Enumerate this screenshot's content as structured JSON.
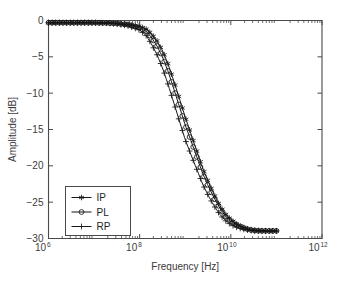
{
  "chart_data": {
    "type": "line",
    "title": "",
    "xlabel": "Frequency [Hz]",
    "ylabel": "Amplitude [dB]",
    "xscale": "log",
    "yscale": "linear",
    "xlim": [
      1000000,
      1000000000000
    ],
    "ylim": [
      -30,
      0
    ],
    "grid": false,
    "legend_position": "lower left",
    "xticks": [
      {
        "value": 1000000,
        "mantissa": "10",
        "exponent": "6",
        "label": "10^6"
      },
      {
        "value": 100000000,
        "mantissa": "10",
        "exponent": "8",
        "label": "10^8"
      },
      {
        "value": 10000000000,
        "mantissa": "10",
        "exponent": "10",
        "label": "10^10"
      },
      {
        "value": 1000000000000,
        "mantissa": "10",
        "exponent": "12",
        "label": "10^12"
      }
    ],
    "yticks": [
      {
        "value": 0,
        "label": "0"
      },
      {
        "value": -5,
        "label": "-5"
      },
      {
        "value": -10,
        "label": "-10"
      },
      {
        "value": -15,
        "label": "-15"
      },
      {
        "value": -20,
        "label": "-20"
      },
      {
        "value": -25,
        "label": "-25"
      },
      {
        "value": -30,
        "label": "-30"
      }
    ],
    "series": [
      {
        "name": "IP",
        "marker": "asterisk",
        "x": [
          1000000.0,
          1800000.0,
          3200000.0,
          5600000.0,
          10000000.0,
          18000000.0,
          32000000.0,
          56000000.0,
          100000000.0,
          140000000.0,
          180000000.0,
          240000000.0,
          320000000.0,
          420000000.0,
          560000000.0,
          750000000.0,
          1000000000.0,
          1400000000.0,
          1800000000.0,
          2400000000.0,
          3200000000.0,
          4200000000.0,
          5600000000.0,
          7500000000.0,
          10000000000.0,
          14000000000.0,
          18000000000.0,
          24000000000.0,
          32000000000.0,
          42000000000.0,
          56000000000.0,
          75000000000.0,
          100000000000.0
        ],
        "y": [
          -0.3,
          -0.3,
          -0.3,
          -0.3,
          -0.3,
          -0.32,
          -0.38,
          -0.5,
          -0.8,
          -1.2,
          -1.8,
          -2.8,
          -4.2,
          -6.0,
          -8.3,
          -10.8,
          -13.3,
          -16.0,
          -18.0,
          -20.3,
          -22.2,
          -23.8,
          -25.4,
          -26.6,
          -27.4,
          -28.1,
          -28.4,
          -28.7,
          -28.85,
          -28.9,
          -28.95,
          -28.95,
          -28.95
        ]
      },
      {
        "name": "PL",
        "marker": "circle",
        "x": [
          1000000.0,
          1800000.0,
          3200000.0,
          5600000.0,
          10000000.0,
          18000000.0,
          32000000.0,
          56000000.0,
          100000000.0,
          140000000.0,
          180000000.0,
          240000000.0,
          320000000.0,
          420000000.0,
          560000000.0,
          750000000.0,
          1000000000.0,
          1400000000.0,
          1800000000.0,
          2400000000.0,
          3200000000.0,
          4200000000.0,
          5600000000.0,
          7500000000.0,
          10000000000.0,
          14000000000.0,
          18000000000.0,
          24000000000.0,
          32000000000.0,
          42000000000.0,
          56000000000.0,
          75000000000.0,
          100000000000.0
        ],
        "y": [
          -0.3,
          -0.3,
          -0.3,
          -0.3,
          -0.3,
          -0.33,
          -0.42,
          -0.6,
          -1.0,
          -1.5,
          -2.3,
          -3.5,
          -5.1,
          -7.0,
          -9.4,
          -11.9,
          -14.4,
          -16.9,
          -18.8,
          -21.0,
          -22.8,
          -24.3,
          -25.7,
          -26.9,
          -27.6,
          -28.2,
          -28.5,
          -28.75,
          -28.9,
          -28.95,
          -28.95,
          -28.95,
          -28.95
        ]
      },
      {
        "name": "RP",
        "marker": "plus",
        "x": [
          1000000.0,
          1800000.0,
          3200000.0,
          5600000.0,
          10000000.0,
          18000000.0,
          32000000.0,
          56000000.0,
          100000000.0,
          140000000.0,
          180000000.0,
          240000000.0,
          320000000.0,
          420000000.0,
          560000000.0,
          750000000.0,
          1000000000.0,
          1400000000.0,
          1800000000.0,
          2400000000.0,
          3200000000.0,
          4200000000.0,
          5600000000.0,
          7500000000.0,
          10000000000.0,
          14000000000.0,
          18000000000.0,
          24000000000.0,
          32000000000.0,
          42000000000.0,
          56000000000.0,
          75000000000.0,
          100000000000.0
        ],
        "y": [
          -0.3,
          -0.3,
          -0.3,
          -0.3,
          -0.3,
          -0.35,
          -0.48,
          -0.75,
          -1.3,
          -2.1,
          -3.2,
          -4.7,
          -6.6,
          -8.8,
          -11.3,
          -13.9,
          -16.4,
          -18.8,
          -20.5,
          -22.5,
          -24.1,
          -25.4,
          -26.6,
          -27.5,
          -28.1,
          -28.5,
          -28.7,
          -28.85,
          -28.95,
          -28.95,
          -28.95,
          -28.95,
          -28.95
        ]
      }
    ],
    "legend": [
      {
        "label": "IP",
        "marker": "asterisk"
      },
      {
        "label": "PL",
        "marker": "circle"
      },
      {
        "label": "RP",
        "marker": "plus"
      }
    ],
    "colors": {
      "series": "#171717",
      "axis": "#4a4a4a",
      "text": "#3b3b3b",
      "background": "#ffffff"
    }
  }
}
